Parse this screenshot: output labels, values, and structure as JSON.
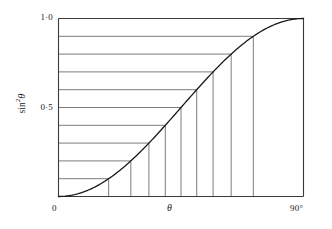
{
  "figure": {
    "axis_titles": {
      "y_sin": "sin",
      "y_exponent": "2",
      "y_theta": "θ",
      "x": "θ"
    },
    "y_ticks": [
      {
        "value": 1.0,
        "label": "1·0"
      },
      {
        "value": 0.5,
        "label": "0·5"
      }
    ],
    "x_ticks": [
      {
        "value": 0,
        "label": "0"
      },
      {
        "value": 90,
        "label": "90°"
      }
    ],
    "colors": {
      "curve": "#1a1a1a",
      "grid": "#6e6e6e",
      "frame": "#3a3a3a",
      "background": "#ffffff"
    }
  },
  "chart_data": {
    "type": "line",
    "title": "",
    "xlabel": "θ",
    "ylabel": "sin²θ",
    "xlim": [
      0,
      90
    ],
    "ylim": [
      0,
      1.0
    ],
    "grid": false,
    "legend": "none",
    "x_tick_labels": [
      "0",
      "90°"
    ],
    "y_tick_labels": [
      "0·5",
      "1·0"
    ],
    "series": [
      {
        "name": "sin²θ",
        "x": [
          0,
          5,
          10,
          15,
          20,
          25,
          30,
          35,
          40,
          45,
          50,
          55,
          60,
          65,
          70,
          75,
          80,
          85,
          90
        ],
        "values": [
          0.0,
          0.0076,
          0.0302,
          0.067,
          0.117,
          0.1786,
          0.25,
          0.329,
          0.4132,
          0.5,
          0.5868,
          0.671,
          0.75,
          0.8214,
          0.883,
          0.933,
          0.9698,
          0.9924,
          1.0
        ]
      }
    ],
    "construction_lines": {
      "description": "Equal increments of sin²θ drawn as horizontal lines from the y-axis to the curve, each dropping a vertical line to the θ axis",
      "sin2_levels": [
        0.1,
        0.2,
        0.3,
        0.4,
        0.5,
        0.6,
        0.7,
        0.8,
        0.9,
        1.0
      ],
      "theta_at_levels": [
        18.43,
        26.57,
        33.21,
        39.23,
        45.0,
        50.77,
        56.79,
        63.43,
        71.57,
        90.0
      ]
    }
  }
}
